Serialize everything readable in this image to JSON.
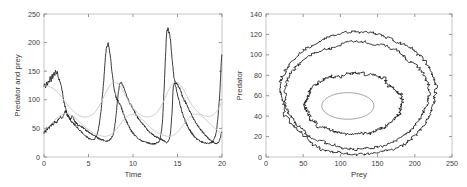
{
  "figure": {
    "background_color": "#ffffff",
    "panel_count": 2,
    "noisy_color": "#1a1a1a",
    "smooth_color": "#c9c9c9",
    "cycle_color": "#6e6e6e",
    "frame_color": "#b9b9b9"
  },
  "chart_data": [
    {
      "type": "line",
      "panel": "left",
      "title": "",
      "xlabel": "Time",
      "ylabel": "Predator and prey",
      "xlim": [
        0,
        20
      ],
      "ylim": [
        0,
        250
      ],
      "xticks": [
        0,
        5,
        10,
        15,
        20
      ],
      "yticks": [
        0,
        50,
        100,
        150,
        200,
        250
      ],
      "xticklabels": [
        "0",
        "5",
        "10",
        "15",
        "20"
      ],
      "yticklabels": [
        "0",
        "50",
        "100",
        "150",
        "200",
        "250"
      ],
      "grid": false,
      "legend": null,
      "series": [
        {
          "name": "prey-stochastic",
          "style": "noisy",
          "color": "#1a1a1a",
          "x": [
            0.0,
            0.1,
            0.2,
            0.3,
            0.4,
            0.5,
            0.6,
            0.7,
            0.8,
            0.9,
            1.0,
            1.1,
            1.2,
            1.3,
            1.4,
            1.5,
            1.6,
            1.7,
            1.8,
            1.9,
            2.0,
            2.2,
            2.4,
            2.6,
            2.8,
            3.0,
            3.2,
            3.4,
            3.6,
            3.8,
            4.0,
            4.3,
            4.6,
            4.9,
            5.2,
            5.5,
            5.8,
            6.1,
            6.4,
            6.7,
            6.9,
            7.1,
            7.2,
            7.3,
            7.5,
            7.7,
            7.9,
            8.1,
            8.4,
            8.7,
            9.0,
            9.4,
            9.8,
            10.2,
            10.6,
            11.0,
            11.4,
            11.8,
            12.2,
            12.6,
            13.0,
            13.3,
            13.5,
            13.7,
            13.8,
            13.9,
            14.0,
            14.2,
            14.4,
            14.6,
            14.9,
            15.2,
            15.6,
            16.0,
            16.5,
            17.0,
            17.5,
            18.0,
            18.5,
            19.0,
            19.4,
            19.7,
            20.0
          ],
          "y": [
            124,
            128,
            122,
            131,
            126,
            135,
            129,
            140,
            133,
            145,
            138,
            149,
            141,
            152,
            144,
            148,
            140,
            136,
            132,
            127,
            120,
            100,
            86,
            76,
            70,
            64,
            60,
            57,
            54,
            50,
            47,
            42,
            38,
            34,
            31,
            30,
            34,
            48,
            80,
            130,
            175,
            194,
            198,
            192,
            170,
            140,
            118,
            104,
            96,
            86,
            72,
            58,
            46,
            38,
            32,
            28,
            26,
            24,
            23,
            24,
            30,
            60,
            120,
            190,
            218,
            224,
            221,
            205,
            170,
            140,
            116,
            96,
            74,
            58,
            44,
            34,
            28,
            25,
            24,
            28,
            48,
            100,
            180
          ]
        },
        {
          "name": "predator-stochastic",
          "style": "noisy",
          "color": "#1a1a1a",
          "x": [
            0.0,
            0.1,
            0.2,
            0.3,
            0.4,
            0.5,
            0.6,
            0.7,
            0.8,
            0.9,
            1.0,
            1.2,
            1.4,
            1.6,
            1.8,
            2.0,
            2.2,
            2.4,
            2.6,
            2.8,
            3.0,
            3.2,
            3.4,
            3.6,
            3.8,
            4.0,
            4.3,
            4.6,
            5.0,
            5.4,
            5.8,
            6.2,
            6.6,
            7.0,
            7.4,
            7.8,
            8.0,
            8.2,
            8.4,
            8.6,
            8.9,
            9.2,
            9.6,
            10.0,
            10.5,
            11.0,
            11.5,
            12.0,
            12.5,
            13.0,
            13.5,
            13.9,
            14.2,
            14.4,
            14.5,
            14.6,
            14.8,
            15.0,
            15.3,
            15.6,
            16.0,
            16.5,
            17.0,
            17.5,
            18.0,
            18.5,
            19.0,
            19.4,
            19.7,
            20.0
          ],
          "y": [
            42,
            46,
            44,
            50,
            48,
            53,
            51,
            56,
            54,
            58,
            56,
            62,
            60,
            66,
            70,
            68,
            74,
            80,
            74,
            70,
            66,
            72,
            64,
            60,
            56,
            54,
            52,
            48,
            44,
            40,
            36,
            32,
            30,
            28,
            30,
            40,
            60,
            90,
            118,
            130,
            124,
            110,
            96,
            84,
            70,
            60,
            50,
            42,
            36,
            32,
            28,
            26,
            40,
            80,
            116,
            128,
            130,
            126,
            118,
            104,
            92,
            76,
            62,
            50,
            40,
            32,
            26,
            24,
            28,
            44
          ]
        },
        {
          "name": "prey-deterministic",
          "style": "smooth",
          "color": "#c9c9c9",
          "x": [
            0.0,
            0.4,
            0.8,
            1.2,
            1.6,
            2.0,
            2.4,
            2.8,
            3.2,
            3.6,
            4.0,
            4.4,
            4.8,
            5.2,
            5.6,
            6.0,
            6.4,
            6.8,
            7.2,
            7.6,
            8.0,
            8.4,
            8.8,
            9.2,
            9.6,
            10.0,
            10.4,
            10.8,
            11.2,
            11.6,
            12.0,
            12.4,
            12.8,
            13.2,
            13.6,
            14.0,
            14.4,
            14.8,
            15.2,
            15.6,
            16.0,
            16.4,
            16.8,
            17.2,
            17.6,
            18.0,
            18.4,
            18.8,
            19.2,
            19.6,
            20.0
          ],
          "y": [
            124,
            124,
            122,
            118,
            112,
            104,
            96,
            88,
            82,
            76,
            72,
            70,
            70,
            72,
            76,
            84,
            95,
            108,
            120,
            128,
            130,
            127,
            118,
            106,
            95,
            86,
            79,
            74,
            71,
            70,
            71,
            74,
            80,
            90,
            103,
            117,
            127,
            131,
            128,
            120,
            108,
            96,
            87,
            80,
            75,
            72,
            71,
            72,
            76,
            84,
            96
          ]
        },
        {
          "name": "predator-deterministic",
          "style": "smooth",
          "color": "#c9c9c9",
          "x": [
            0.0,
            0.4,
            0.8,
            1.2,
            1.6,
            2.0,
            2.4,
            2.8,
            3.2,
            3.6,
            4.0,
            4.4,
            4.8,
            5.2,
            5.6,
            6.0,
            6.4,
            6.8,
            7.2,
            7.6,
            8.0,
            8.4,
            8.8,
            9.2,
            9.6,
            10.0,
            10.4,
            10.8,
            11.2,
            11.6,
            12.0,
            12.4,
            12.8,
            13.2,
            13.6,
            14.0,
            14.4,
            14.8,
            15.2,
            15.6,
            16.0,
            16.4,
            16.8,
            17.2,
            17.6,
            18.0,
            18.4,
            18.8,
            19.2,
            19.6,
            20.0
          ],
          "y": [
            46,
            52,
            58,
            64,
            70,
            74,
            76,
            75,
            72,
            67,
            61,
            55,
            50,
            46,
            42,
            39,
            37,
            36,
            37,
            40,
            46,
            54,
            62,
            69,
            73,
            75,
            73,
            69,
            63,
            57,
            51,
            46,
            42,
            39,
            37,
            36,
            37,
            41,
            47,
            55,
            63,
            70,
            74,
            75,
            73,
            68,
            62,
            56,
            50,
            45,
            41
          ]
        }
      ]
    },
    {
      "type": "line",
      "panel": "right",
      "title": "",
      "xlabel": "Prey",
      "ylabel": "Predator",
      "xlim": [
        0,
        250
      ],
      "ylim": [
        0,
        140
      ],
      "xticks": [
        0,
        50,
        100,
        150,
        200,
        250
      ],
      "yticks": [
        0,
        20,
        40,
        60,
        80,
        100,
        120,
        140
      ],
      "xticklabels": [
        "0",
        "50",
        "100",
        "150",
        "200",
        "250"
      ],
      "yticklabels": [
        "0",
        "20",
        "40",
        "60",
        "80",
        "100",
        "120",
        "140"
      ],
      "grid": false,
      "legend": null,
      "series": [
        {
          "name": "phase-orbit-outer",
          "style": "noisy",
          "color": "#1a1a1a",
          "closed": true,
          "center": [
            124,
            62
          ],
          "rx": 104,
          "ry": 60,
          "noise": 3.2
        },
        {
          "name": "phase-orbit-middle",
          "style": "noisy",
          "color": "#1a1a1a",
          "closed": true,
          "center": [
            122,
            60
          ],
          "rx": 96,
          "ry": 52,
          "noise": 3.0
        },
        {
          "name": "phase-orbit-inner",
          "style": "noisy",
          "color": "#1a1a1a",
          "closed": true,
          "center": [
            118,
            52
          ],
          "rx": 64,
          "ry": 30,
          "noise": 3.5
        },
        {
          "name": "phase-limit-cycle",
          "style": "cycle",
          "color": "#6e6e6e",
          "closed": true,
          "center": [
            110,
            50
          ],
          "rx": 35,
          "ry": 13,
          "noise": 0
        }
      ]
    }
  ]
}
